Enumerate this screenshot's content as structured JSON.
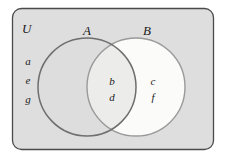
{
  "figure": {
    "kind": "venn-diagram",
    "universe_label": "U",
    "background_color": "#dedede",
    "page_color": "#ffffff",
    "border_color": "#4a4a4a"
  },
  "sets": {
    "a": {
      "label": "A",
      "fill_color": "#dcdcdc",
      "stroke_color": "#6e6e6e",
      "center_x": 87,
      "center_y": 87,
      "radius": 49
    },
    "b": {
      "label": "B",
      "fill_color": "#fbfbfa",
      "stroke_color": "#9a9a9a",
      "center_x": 136,
      "center_y": 87,
      "radius": 49
    }
  },
  "regions": {
    "outside_only": {
      "name": "outside-both-sets",
      "elements": [
        "a",
        "e",
        "g"
      ]
    },
    "a_only": {
      "name": "a-only",
      "elements": []
    },
    "intersection": {
      "name": "a-intersect-b",
      "elements": [
        "b",
        "d"
      ]
    },
    "b_only": {
      "name": "b-only",
      "elements": [
        "c",
        "f"
      ]
    }
  }
}
